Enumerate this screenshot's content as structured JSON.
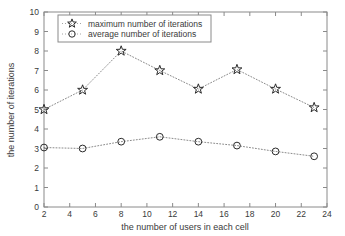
{
  "chart_data": {
    "type": "line",
    "title": "",
    "xlabel": "the number of users in each cell",
    "ylabel": "the number of iterations",
    "x": [
      2,
      5,
      8,
      11,
      14,
      17,
      20,
      23
    ],
    "xlim": [
      2,
      24
    ],
    "ylim": [
      0,
      10
    ],
    "xticks": [
      2,
      4,
      6,
      8,
      10,
      12,
      14,
      16,
      18,
      20,
      22,
      24
    ],
    "yticks": [
      0,
      1,
      2,
      3,
      4,
      5,
      6,
      7,
      8,
      9,
      10
    ],
    "grid": false,
    "legend_position": "upper left",
    "series": [
      {
        "name": "maximum number of iterations",
        "marker": "star",
        "linestyle": "dotted",
        "color": "#2b2b2b",
        "values": [
          5.0,
          6.0,
          8.0,
          7.0,
          6.05,
          7.05,
          6.05,
          5.1
        ]
      },
      {
        "name": "average number of iterations",
        "marker": "circle",
        "linestyle": "dotted",
        "color": "#2b2b2b",
        "values": [
          3.05,
          3.0,
          3.35,
          3.6,
          3.35,
          3.15,
          2.85,
          2.6
        ]
      }
    ]
  },
  "axis": {
    "xlabel": "the number of users in each cell",
    "ylabel": "the number of iterations",
    "xticklabels": [
      "2",
      "4",
      "6",
      "8",
      "10",
      "12",
      "14",
      "16",
      "18",
      "20",
      "22",
      "24"
    ],
    "yticklabels": [
      "0",
      "1",
      "2",
      "3",
      "4",
      "5",
      "6",
      "7",
      "8",
      "9",
      "10"
    ]
  },
  "legend": {
    "entries": [
      {
        "label": "maximum number of iterations",
        "marker": "star-marker"
      },
      {
        "label": "average number of iterations",
        "marker": "circle-marker"
      }
    ]
  },
  "colors": {
    "background": "#ffffff",
    "frame": "#8a8a8a",
    "line": "#7d7d7d",
    "marker": "#2b2b2b",
    "text": "#3a3a3a"
  }
}
